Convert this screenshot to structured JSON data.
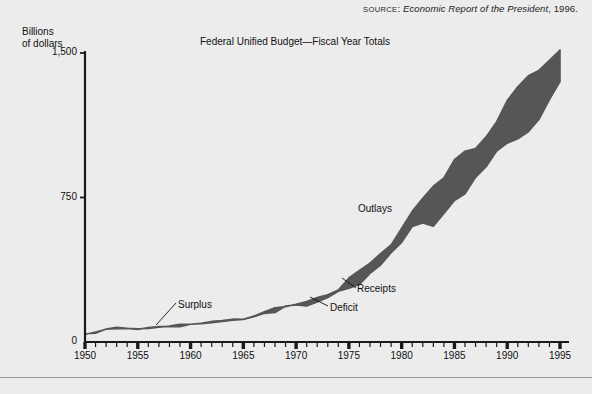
{
  "figure": {
    "source_prefix": "SOURCE",
    "source_separator": ": ",
    "source_title": "Economic Report of the President",
    "source_suffix": ", 1996.",
    "axis_caption_line1": "Billions",
    "axis_caption_line2": "of dollars"
  },
  "annotations": {
    "outlays": "Outlays",
    "receipts": "Receipts",
    "deficit": "Deficit",
    "surplus": "Surplus"
  },
  "colors": {
    "band_fill": "#565656",
    "background": "#ececec",
    "axis": "#1a1a1a",
    "text": "#111111",
    "rule": "#9a9a9a"
  },
  "chart_data": {
    "type": "area",
    "title": "Federal Unified Budget—Fiscal Year Totals",
    "xlabel": "",
    "ylabel": "Billions of dollars",
    "xlim": [
      1950,
      1995
    ],
    "ylim": [
      0,
      1500
    ],
    "yticks": [
      0,
      750,
      1500
    ],
    "ytick_labels": [
      "0",
      "750",
      "1,500"
    ],
    "xticks": [
      1950,
      1955,
      1960,
      1965,
      1970,
      1975,
      1980,
      1985,
      1990,
      1995
    ],
    "xtick_labels": [
      "1950",
      "1955",
      "1960",
      "1965",
      "1970",
      "1975",
      "1980",
      "1985",
      "1990",
      "1995"
    ],
    "minor_xtick_step": 1,
    "grid": false,
    "legend": "inline-annotations",
    "fill_between": "Outlays (upper) and Receipts (lower); gap shaded = Deficit, crossover = Surplus",
    "x": [
      1950,
      1951,
      1952,
      1953,
      1954,
      1955,
      1956,
      1957,
      1958,
      1959,
      1960,
      1961,
      1962,
      1963,
      1964,
      1965,
      1966,
      1967,
      1968,
      1969,
      1970,
      1971,
      1972,
      1973,
      1974,
      1975,
      1976,
      1977,
      1978,
      1979,
      1980,
      1981,
      1982,
      1983,
      1984,
      1985,
      1986,
      1987,
      1988,
      1989,
      1990,
      1991,
      1992,
      1993,
      1994,
      1995
    ],
    "series": [
      {
        "name": "Outlays",
        "values": [
          42.6,
          45.5,
          67.7,
          76.1,
          70.9,
          68.4,
          70.6,
          76.6,
          82.4,
          92.1,
          92.2,
          97.7,
          106.8,
          111.3,
          118.5,
          118.2,
          134.5,
          157.5,
          178.1,
          183.6,
          195.6,
          210.2,
          230.7,
          245.7,
          269.4,
          332.3,
          371.8,
          409.2,
          458.7,
          504.0,
          590.9,
          678.2,
          745.7,
          808.4,
          851.8,
          946.4,
          990.4,
          1004.1,
          1064.5,
          1143.7,
          1253.2,
          1324.4,
          1381.7,
          1409.5,
          1461.9,
          1515.8
        ]
      },
      {
        "name": "Receipts",
        "values": [
          39.4,
          51.6,
          66.2,
          69.6,
          69.7,
          65.5,
          74.6,
          80.0,
          79.6,
          79.2,
          92.5,
          94.4,
          99.7,
          106.6,
          112.6,
          116.8,
          130.8,
          148.8,
          153.0,
          186.9,
          192.8,
          187.1,
          207.3,
          230.8,
          263.2,
          279.1,
          298.1,
          355.6,
          399.6,
          463.3,
          517.1,
          599.3,
          617.8,
          600.6,
          666.5,
          734.1,
          769.2,
          854.4,
          909.3,
          991.2,
          1032.0,
          1055.0,
          1091.3,
          1154.4,
          1258.6,
          1351.8
        ]
      }
    ]
  }
}
